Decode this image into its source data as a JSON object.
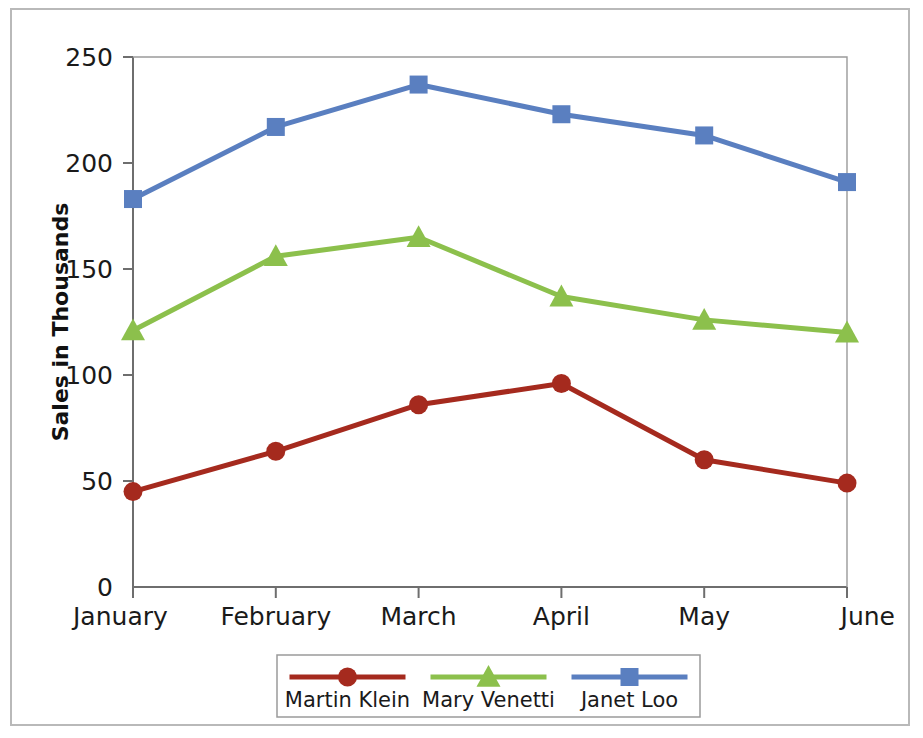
{
  "chart_data": {
    "type": "line",
    "title": "",
    "xlabel": "",
    "ylabel": "Sales in Thousands",
    "categories": [
      "January",
      "February",
      "March",
      "April",
      "May",
      "June"
    ],
    "ylim": [
      0,
      250
    ],
    "yticks": [
      0,
      50,
      100,
      150,
      200,
      250
    ],
    "ytick_labels": [
      "0",
      "50",
      "100",
      "150",
      "200",
      "250"
    ],
    "grid": false,
    "legend_position": "bottom",
    "series": [
      {
        "name": "Martin Klein",
        "color": "#a52a1e",
        "marker": "circle",
        "values": [
          45,
          64,
          86,
          96,
          60,
          49
        ]
      },
      {
        "name": "Mary Venetti",
        "color": "#8cc04c",
        "marker": "triangle",
        "values": [
          121,
          156,
          165,
          137,
          126,
          120
        ]
      },
      {
        "name": "Janet Loo",
        "color": "#5a7fc0",
        "marker": "square",
        "values": [
          183,
          217,
          237,
          223,
          213,
          191
        ]
      }
    ]
  },
  "frame": {
    "border_color": "#b9b9b9",
    "background": "#ffffff"
  },
  "axis": {
    "line_color": "#6e6e6e"
  }
}
